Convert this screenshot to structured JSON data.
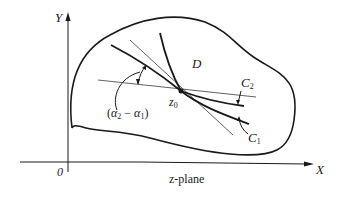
{
  "figure": {
    "plane_label": "z-plane",
    "axes": {
      "x_label": "X",
      "y_label": "Y",
      "origin_label": "0"
    },
    "region_label": "D",
    "point_label": "z",
    "point_subscript": "0",
    "curves": [
      {
        "name": "C",
        "subscript": "2"
      },
      {
        "name": "C",
        "subscript": "1"
      }
    ],
    "angle_label": "(α₂ − α₁)",
    "angle_label_parts": {
      "open": "(",
      "alpha": "α",
      "sub2": "2",
      "minus": " − ",
      "sub1": "1",
      "close": ")"
    },
    "colors": {
      "ink": "#1a1a1a",
      "thin_line": "#3a3a3a",
      "background": "#ffffff"
    }
  }
}
